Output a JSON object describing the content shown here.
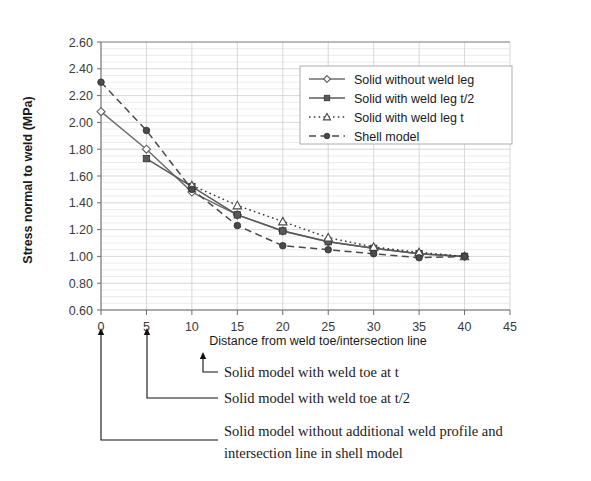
{
  "chart_data": {
    "type": "line",
    "title": "",
    "xlabel": "Distance from weld toe/intersection line",
    "ylabel": "Stress normal to weld (MPa)",
    "xlim": [
      0,
      45
    ],
    "ylim": [
      0.6,
      2.6
    ],
    "xticks": [
      0,
      5,
      10,
      15,
      20,
      25,
      30,
      35,
      40,
      45
    ],
    "yticks": [
      0.6,
      0.8,
      1.0,
      1.2,
      1.4,
      1.6,
      1.8,
      2.0,
      2.2,
      2.4,
      2.6
    ],
    "xtick_labels": [
      "0",
      "5",
      "10",
      "15",
      "20",
      "25",
      "30",
      "35",
      "40",
      "45"
    ],
    "ytick_labels": [
      "0.60",
      "0.80",
      "1.00",
      "1.20",
      "1.40",
      "1.60",
      "1.80",
      "2.00",
      "2.20",
      "2.40",
      "2.60"
    ],
    "grid": true,
    "legend_position": "upper right",
    "series": [
      {
        "name": "Solid without weld leg",
        "marker": "diamond",
        "linestyle": "solid",
        "color": "#6e6e6e",
        "x": [
          0,
          5,
          10,
          15,
          20,
          25,
          30,
          35,
          40
        ],
        "values": [
          2.08,
          1.8,
          1.48,
          1.31,
          1.19,
          1.11,
          1.06,
          1.02,
          1.0
        ]
      },
      {
        "name": "Solid with weld leg t/2",
        "marker": "square",
        "linestyle": "solid",
        "color": "#5a5a5a",
        "x": [
          5,
          10,
          15,
          20,
          25,
          30,
          35,
          40
        ],
        "values": [
          1.73,
          1.52,
          1.31,
          1.19,
          1.11,
          1.06,
          1.02,
          1.0
        ]
      },
      {
        "name": "Solid with weld leg t",
        "marker": "triangle",
        "linestyle": "dotted",
        "color": "#3a3a3a",
        "x": [
          10,
          15,
          20,
          25,
          30,
          35,
          40
        ],
        "values": [
          1.53,
          1.38,
          1.26,
          1.14,
          1.07,
          1.03,
          1.0
        ]
      },
      {
        "name": "Shell model",
        "marker": "circle",
        "linestyle": "dashed",
        "color": "#4a4a4a",
        "x": [
          0,
          5,
          10,
          15,
          20,
          25,
          30,
          35,
          40
        ],
        "values": [
          2.3,
          1.94,
          1.5,
          1.23,
          1.08,
          1.05,
          1.02,
          0.99,
          1.0
        ]
      }
    ]
  },
  "legend": {
    "items": [
      {
        "label": "Solid without weld leg"
      },
      {
        "label": "Solid with weld leg t/2"
      },
      {
        "label": "Solid with weld leg t"
      },
      {
        "label": "Shell model"
      }
    ]
  },
  "annotations": [
    {
      "label": "Solid model with weld toe at t"
    },
    {
      "label": "Solid model with weld toe at t/2"
    },
    {
      "label": "Solid model without additional weld profile and"
    },
    {
      "label": "intersection line in shell model"
    }
  ]
}
